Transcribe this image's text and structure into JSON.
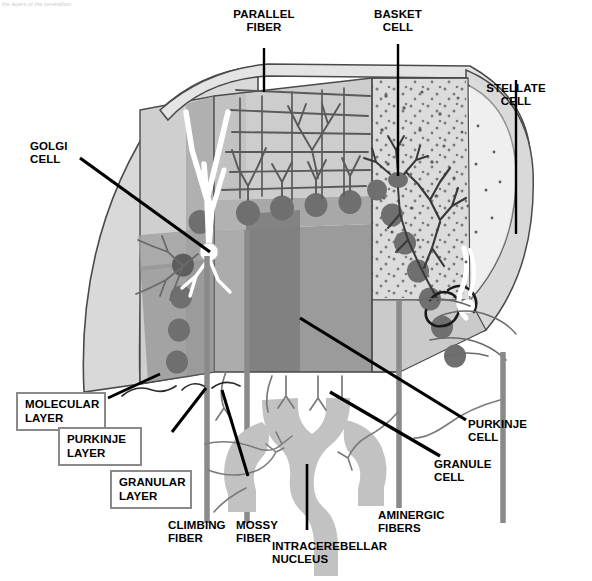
{
  "figure": {
    "caption_top": "the layers of the cerebellum",
    "type": "anatomical-diagram"
  },
  "colors": {
    "outline": "#4a4a4a",
    "molecular_layer": "#d4d4d4",
    "molecular_layer_front": "#c2c2c2",
    "purkinje_layer": "#9a9a9a",
    "granular_layer": "#8e8e8e",
    "granular_layer_dark": "#747474",
    "top_surface": "#e2e2e2",
    "side_face": "#cfcfcf",
    "cell_body": "#6e6e6e",
    "fiber": "#7a7a7a",
    "nucleus": "#c0c0c0",
    "label_text": "#000000",
    "box_border": "#8a8a8a",
    "leader_line": "#000000",
    "background": "#ffffff"
  },
  "labels": {
    "parallel_fiber": "PARALLEL\nFIBER",
    "basket_cell": "BASKET\nCELL",
    "stellate_cell": "STELLATE\nCELL",
    "golgi_cell": "GOLGI\nCELL",
    "purkinje_cell": "PURKINJE\nCELL",
    "granule_cell": "GRANULE\nCELL",
    "aminergic_fibers": "AMINERGIC\nFIBERS",
    "climbing_fiber": "CLIMBING\nFIBER",
    "mossy_fiber": "MOSSY\nFIBER",
    "intracerebellar_nucleus": "INTRACEREBELLAR\nNUCLEUS"
  },
  "boxed_labels": {
    "molecular_layer": "MOLECULAR\nLAYER",
    "purkinje_layer": "PURKINJE\nLAYER",
    "granular_layer": "GRANULAR\nLAYER"
  },
  "structures": [
    {
      "name": "molecular-layer",
      "description": "outermost light gray layer containing parallel fibers, stellate and basket cells"
    },
    {
      "name": "purkinje-layer",
      "description": "single row of large Purkinje cell bodies"
    },
    {
      "name": "granular-layer",
      "description": "dense inner layer of granule cells and glomeruli"
    },
    {
      "name": "intracerebellar-nucleus",
      "description": "gray zig-zag band of deep cerebellar nuclei beneath the cortex"
    }
  ]
}
